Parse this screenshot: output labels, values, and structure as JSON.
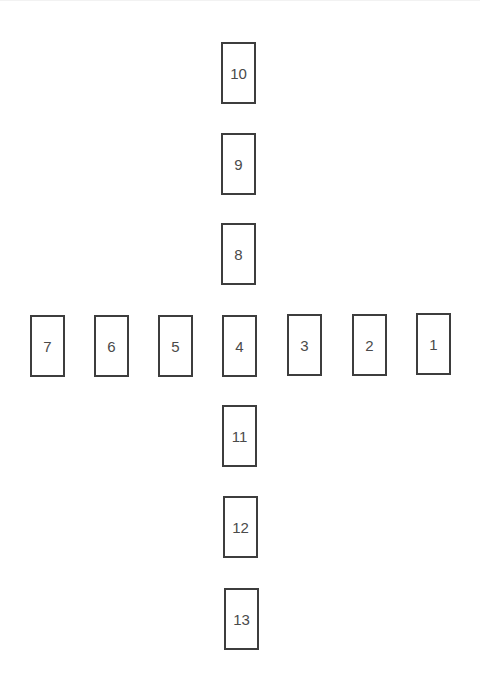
{
  "diagram": {
    "type": "card-spread-layout",
    "border_color": "#3d3d3d",
    "text_color": "#4a4a4a",
    "cards": [
      {
        "label": "1",
        "x": 416,
        "y": 313
      },
      {
        "label": "2",
        "x": 352,
        "y": 314
      },
      {
        "label": "3",
        "x": 287,
        "y": 314
      },
      {
        "label": "4",
        "x": 222,
        "y": 315
      },
      {
        "label": "5",
        "x": 158,
        "y": 315
      },
      {
        "label": "6",
        "x": 94,
        "y": 315
      },
      {
        "label": "7",
        "x": 30,
        "y": 315
      },
      {
        "label": "8",
        "x": 221,
        "y": 223
      },
      {
        "label": "9",
        "x": 221,
        "y": 133
      },
      {
        "label": "10",
        "x": 221,
        "y": 42
      },
      {
        "label": "11",
        "x": 222,
        "y": 405
      },
      {
        "label": "12",
        "x": 223,
        "y": 496
      },
      {
        "label": "13",
        "x": 224,
        "y": 588
      }
    ]
  }
}
